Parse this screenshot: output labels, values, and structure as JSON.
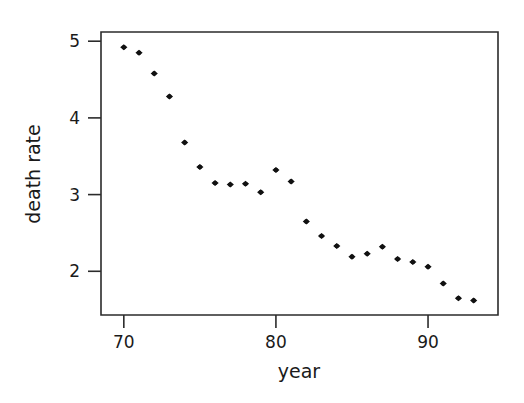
{
  "chart_data": {
    "type": "scatter",
    "title": "",
    "xlabel": "year",
    "ylabel": "death rate",
    "xlim": [
      68.5,
      94.6
    ],
    "ylim": [
      1.43,
      5.12
    ],
    "xticks": [
      70,
      80,
      90
    ],
    "xticklabels": [
      "70",
      "80",
      "90"
    ],
    "yticks": [
      2,
      3,
      4,
      5
    ],
    "yticklabels": [
      "2",
      "3",
      "4",
      "5"
    ],
    "grid": false,
    "legend": null,
    "marker": "filled-diamond",
    "marker_color": "#111111",
    "x": [
      70,
      71,
      72,
      73,
      74,
      75,
      76,
      77,
      78,
      79,
      80,
      81,
      82,
      83,
      84,
      85,
      86,
      87,
      88,
      89,
      90,
      91,
      92,
      93
    ],
    "y": [
      4.92,
      4.85,
      3.9,
      4.28,
      3.68,
      3.36,
      3.15,
      3.13,
      3.14,
      3.03,
      3.32,
      3.17,
      2.65,
      2.46,
      2.33,
      2.19,
      2.23,
      2.32,
      2.16,
      2.12,
      2.06,
      1.84,
      1.65,
      1.62
    ],
    "points": [
      {
        "year": 70,
        "death_rate": 4.92
      },
      {
        "year": 71,
        "death_rate": 4.85
      },
      {
        "year": 72,
        "death_rate": 4.58
      },
      {
        "year": 73,
        "death_rate": 4.28
      },
      {
        "year": 74,
        "death_rate": 3.68
      },
      {
        "year": 75,
        "death_rate": 3.36
      },
      {
        "year": 76,
        "death_rate": 3.15
      },
      {
        "year": 77,
        "death_rate": 3.13
      },
      {
        "year": 78,
        "death_rate": 3.14
      },
      {
        "year": 79,
        "death_rate": 3.03
      },
      {
        "year": 80,
        "death_rate": 3.32
      },
      {
        "year": 81,
        "death_rate": 3.17
      },
      {
        "year": 82,
        "death_rate": 2.65
      },
      {
        "year": 83,
        "death_rate": 2.46
      },
      {
        "year": 84,
        "death_rate": 2.33
      },
      {
        "year": 85,
        "death_rate": 2.19
      },
      {
        "year": 86,
        "death_rate": 2.23
      },
      {
        "year": 87,
        "death_rate": 2.32
      },
      {
        "year": 88,
        "death_rate": 2.16
      },
      {
        "year": 89,
        "death_rate": 2.12
      },
      {
        "year": 90,
        "death_rate": 2.06
      },
      {
        "year": 91,
        "death_rate": 1.84
      },
      {
        "year": 92,
        "death_rate": 1.65
      },
      {
        "year": 93,
        "death_rate": 1.62
      }
    ]
  },
  "colors": {
    "axis": "#2b2b2b",
    "marker": "#111111",
    "text": "#1a1a1a",
    "background": "#ffffff"
  }
}
